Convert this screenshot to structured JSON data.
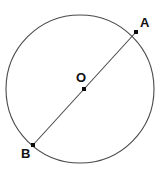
{
  "figure": {
    "title": "Circle with diameter AB through center O",
    "canvas": {
      "width": 168,
      "height": 176,
      "background": "#ffffff"
    },
    "stroke_color": "#4a4a4a",
    "marker_color": "#0d0d0d",
    "label_color": "#111111",
    "circle": {
      "name": "circle-outline",
      "center_x": 80,
      "center_y": 89,
      "radius": 74
    },
    "diameter": {
      "name": "diameter-ab",
      "x1": 33,
      "y1": 145,
      "x2": 136,
      "y2": 32
    },
    "points": [
      {
        "id": "A",
        "label": "A",
        "x": 136,
        "y": 32,
        "marker_size": 4,
        "label_x": 140,
        "label_y": 27
      },
      {
        "id": "O",
        "label": "O",
        "x": 84,
        "y": 89,
        "marker_size": 4,
        "label_x": 76,
        "label_y": 82
      },
      {
        "id": "B",
        "label": "B",
        "x": 33,
        "y": 145,
        "marker_size": 4,
        "label_x": 21,
        "label_y": 158
      }
    ]
  }
}
